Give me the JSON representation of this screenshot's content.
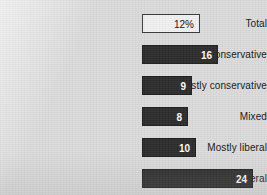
{
  "chart_data": {
    "type": "bar",
    "orientation": "horizontal",
    "title": "",
    "xlabel": "",
    "ylabel": "",
    "grid": false,
    "legend": null,
    "categories": [
      "Total",
      "Consistently conservative",
      "Mostly conservative",
      "Mixed",
      "Mostly liberal",
      "Consistently liberal"
    ],
    "values": [
      12,
      16,
      9,
      8,
      10,
      24
    ],
    "value_labels": [
      "12%",
      "16",
      "9",
      "8",
      "10",
      "24"
    ],
    "bars": [
      {
        "label": "Total",
        "value": 12,
        "value_label": "12%",
        "style": "outline",
        "fill": "#f2f2f2",
        "text_color": "#111111",
        "bar_px_width": 58,
        "top_px": 14
      },
      {
        "label": "Consistently conservative",
        "value": 16,
        "value_label": "16",
        "style": "filled",
        "fill": "#2b2b2b",
        "text_color": "#ffffff",
        "bar_px_width": 76,
        "top_px": 45
      },
      {
        "label": "Mostly conservative",
        "value": 9,
        "value_label": "9",
        "style": "filled",
        "fill": "#2b2b2b",
        "text_color": "#ffffff",
        "bar_px_width": 50,
        "top_px": 76
      },
      {
        "label": "Mixed",
        "value": 8,
        "value_label": "8",
        "style": "filled",
        "fill": "#2b2b2b",
        "text_color": "#ffffff",
        "bar_px_width": 46,
        "top_px": 107
      },
      {
        "label": "Mostly liberal",
        "value": 10,
        "value_label": "10",
        "style": "filled",
        "fill": "#2b2b2b",
        "text_color": "#ffffff",
        "bar_px_width": 54,
        "top_px": 138
      },
      {
        "label": "Consistently liberal",
        "value": 24,
        "value_label": "24",
        "style": "filled",
        "fill": "#2b2b2b",
        "text_color": "#ffffff",
        "bar_px_width": 111,
        "top_px": 169
      }
    ],
    "colors": {
      "background": "#dcdcdc",
      "bar_fill": "#2b2b2b",
      "bar_outline_fill": "#f2f2f2",
      "bar_border": "#1b1b1b",
      "label_text": "#141414"
    }
  }
}
